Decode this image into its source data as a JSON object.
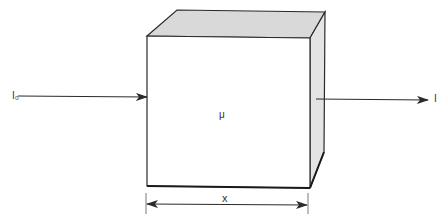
{
  "diagram": {
    "incident_label": "I₀",
    "transmitted_label": "I",
    "coefficient_label": "μ",
    "thickness_label": "x",
    "colors": {
      "line": "#2a2a2a",
      "top_face": "#d9d9d9",
      "side_face": "#e4e4e4",
      "front_face": "#ffffff"
    }
  }
}
